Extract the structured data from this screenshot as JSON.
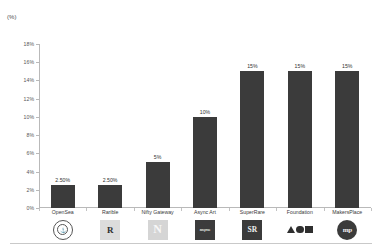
{
  "chart_data": {
    "type": "bar",
    "title": "",
    "subtitle": "",
    "unit_label": "(%)",
    "xlabel": "",
    "ylabel": "",
    "ylim": [
      0,
      18
    ],
    "ytick_step": 2,
    "ytick_labels": [
      "0%",
      "2%",
      "4%",
      "6%",
      "8%",
      "10%",
      "12%",
      "14%",
      "16%",
      "18%"
    ],
    "ytick_values": [
      0,
      2,
      4,
      6,
      8,
      10,
      12,
      14,
      16,
      18
    ],
    "grid": false,
    "legend": "none",
    "bar_color": "#3b3b3b",
    "axis_color": "#b9b9b9",
    "categories": [
      "OpenSea",
      "Rarible",
      "Nifty Gateway",
      "Async Art",
      "SuperRare",
      "Foundation",
      "MakersPlace"
    ],
    "values": [
      2.5,
      2.5,
      5,
      10,
      15,
      15,
      15
    ],
    "data_labels": [
      "2.50%",
      "2.50%",
      "5%",
      "10%",
      "15%",
      "15%",
      "15%"
    ],
    "logos": [
      {
        "name": "opensea-logo",
        "glyph": "⚓",
        "style": "opensea"
      },
      {
        "name": "rarible-logo",
        "glyph": "R",
        "style": "rarible"
      },
      {
        "name": "nifty-gateway-logo",
        "glyph": "N",
        "style": "nifty"
      },
      {
        "name": "async-art-logo",
        "glyph": "async",
        "style": "async"
      },
      {
        "name": "superrare-logo",
        "glyph": "SR",
        "style": "superrare"
      },
      {
        "name": "foundation-logo",
        "glyph": "",
        "style": "foundation"
      },
      {
        "name": "makersplace-logo",
        "glyph": "mp",
        "style": "makersplace"
      }
    ]
  }
}
